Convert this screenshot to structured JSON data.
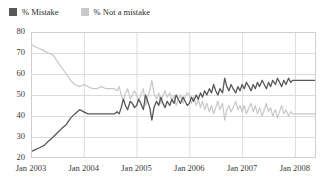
{
  "chart_data": {
    "type": "line",
    "title": "",
    "subtitle": "",
    "xlabel": "",
    "ylabel": "",
    "ylim": [
      20,
      80
    ],
    "ytick_labels": [
      "80",
      "70",
      "60",
      "50",
      "40",
      "30",
      "20"
    ],
    "ytick_values": [
      80,
      70,
      60,
      50,
      40,
      30,
      20
    ],
    "xtick_labels": [
      "Jan 2003",
      "Jan 2004",
      "Jan 2005",
      "Jan 2006",
      "Jan 2007",
      "Jan 2008"
    ],
    "xtick_values": [
      2003.0,
      2004.0,
      2005.0,
      2006.0,
      2007.0,
      2008.0
    ],
    "xlim": [
      2003.0,
      2008.4
    ],
    "grid": true,
    "legend_position": "top-left",
    "series": [
      {
        "name": "% Mistake",
        "color": "#585858",
        "x": [
          2003.0,
          2003.08,
          2003.17,
          2003.25,
          2003.33,
          2003.42,
          2003.5,
          2003.58,
          2003.67,
          2003.75,
          2003.83,
          2003.92,
          2004.0,
          2004.08,
          2004.17,
          2004.25,
          2004.33,
          2004.42,
          2004.5,
          2004.58,
          2004.63,
          2004.67,
          2004.71,
          2004.75,
          2004.79,
          2004.83,
          2004.88,
          2004.92,
          2004.96,
          2005.0,
          2005.04,
          2005.08,
          2005.13,
          2005.17,
          2005.21,
          2005.25,
          2005.29,
          2005.33,
          2005.38,
          2005.42,
          2005.46,
          2005.5,
          2005.54,
          2005.58,
          2005.63,
          2005.67,
          2005.71,
          2005.75,
          2005.79,
          2005.83,
          2005.88,
          2005.92,
          2005.96,
          2006.0,
          2006.04,
          2006.08,
          2006.13,
          2006.17,
          2006.21,
          2006.25,
          2006.29,
          2006.33,
          2006.38,
          2006.42,
          2006.46,
          2006.5,
          2006.54,
          2006.58,
          2006.63,
          2006.67,
          2006.71,
          2006.75,
          2006.79,
          2006.83,
          2006.88,
          2006.92,
          2006.96,
          2007.0,
          2007.04,
          2007.08,
          2007.13,
          2007.17,
          2007.21,
          2007.25,
          2007.29,
          2007.33,
          2007.38,
          2007.42,
          2007.46,
          2007.5,
          2007.54,
          2007.58,
          2007.63,
          2007.67,
          2007.71,
          2007.75,
          2007.79,
          2007.83,
          2007.88,
          2007.92,
          2007.96,
          2008.0,
          2008.1,
          2008.2,
          2008.3,
          2008.4
        ],
        "values": [
          23,
          24,
          25,
          26,
          28,
          30,
          32,
          34,
          36,
          39,
          41,
          43,
          42,
          41,
          41,
          41,
          41,
          41,
          41,
          41,
          42,
          41,
          44,
          48,
          45,
          43,
          47,
          46,
          44,
          45,
          48,
          46,
          43,
          50,
          47,
          44,
          38,
          44,
          47,
          45,
          49,
          46,
          44,
          47,
          45,
          48,
          46,
          50,
          48,
          46,
          49,
          47,
          45,
          46,
          49,
          47,
          50,
          48,
          51,
          49,
          52,
          50,
          53,
          51,
          55,
          52,
          50,
          53,
          51,
          58,
          54,
          52,
          55,
          53,
          51,
          54,
          52,
          55,
          53,
          56,
          54,
          52,
          55,
          53,
          56,
          54,
          57,
          55,
          53,
          56,
          54,
          57,
          55,
          58,
          56,
          54,
          57,
          55,
          58,
          56,
          57,
          57,
          57,
          57,
          57,
          57
        ]
      },
      {
        "name": "% Not a mistake",
        "color": "#c8c8c8",
        "x": [
          2003.0,
          2003.08,
          2003.17,
          2003.25,
          2003.33,
          2003.42,
          2003.5,
          2003.58,
          2003.67,
          2003.75,
          2003.83,
          2003.92,
          2004.0,
          2004.08,
          2004.17,
          2004.25,
          2004.33,
          2004.42,
          2004.5,
          2004.58,
          2004.63,
          2004.67,
          2004.71,
          2004.75,
          2004.79,
          2004.83,
          2004.88,
          2004.92,
          2004.96,
          2005.0,
          2005.04,
          2005.08,
          2005.13,
          2005.17,
          2005.21,
          2005.25,
          2005.29,
          2005.33,
          2005.38,
          2005.42,
          2005.46,
          2005.5,
          2005.54,
          2005.58,
          2005.63,
          2005.67,
          2005.71,
          2005.75,
          2005.79,
          2005.83,
          2005.88,
          2005.92,
          2005.96,
          2006.0,
          2006.04,
          2006.08,
          2006.13,
          2006.17,
          2006.21,
          2006.25,
          2006.29,
          2006.33,
          2006.38,
          2006.42,
          2006.46,
          2006.5,
          2006.54,
          2006.58,
          2006.63,
          2006.67,
          2006.71,
          2006.75,
          2006.79,
          2006.83,
          2006.88,
          2006.92,
          2006.96,
          2007.0,
          2007.04,
          2007.08,
          2007.13,
          2007.17,
          2007.21,
          2007.25,
          2007.29,
          2007.33,
          2007.38,
          2007.42,
          2007.46,
          2007.5,
          2007.54,
          2007.58,
          2007.63,
          2007.67,
          2007.71,
          2007.75,
          2007.79,
          2007.83,
          2007.88,
          2007.92,
          2007.96,
          2008.0,
          2008.1,
          2008.2,
          2008.3,
          2008.4
        ],
        "values": [
          74,
          73,
          72,
          71,
          70,
          69,
          66,
          63,
          60,
          57,
          55,
          54,
          55,
          54,
          53,
          53,
          54,
          53,
          53,
          53,
          52,
          54,
          50,
          47,
          51,
          53,
          48,
          50,
          52,
          50,
          47,
          50,
          53,
          45,
          49,
          52,
          57,
          51,
          48,
          51,
          46,
          50,
          52,
          49,
          51,
          47,
          50,
          45,
          48,
          50,
          46,
          49,
          51,
          50,
          46,
          49,
          45,
          48,
          44,
          47,
          43,
          46,
          42,
          45,
          41,
          44,
          47,
          43,
          46,
          38,
          43,
          45,
          42,
          44,
          47,
          43,
          45,
          42,
          45,
          41,
          44,
          46,
          42,
          45,
          41,
          44,
          40,
          43,
          46,
          42,
          44,
          40,
          43,
          39,
          42,
          45,
          41,
          43,
          40,
          42,
          41,
          41,
          41,
          41,
          41,
          41
        ]
      }
    ]
  },
  "legend": {
    "entries": [
      {
        "label": "% Mistake",
        "color": "#585858"
      },
      {
        "label": "% Not a mistake",
        "color": "#c8c8c8"
      }
    ]
  }
}
